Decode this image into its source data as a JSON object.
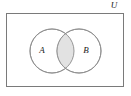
{
  "figure": {
    "kind": "venn-diagram",
    "width": 131,
    "height": 96,
    "background_color": "#ffffff"
  },
  "universe": {
    "label": "U",
    "label_x": 114,
    "label_y": 6,
    "rect": {
      "x": 6,
      "y": 13,
      "width": 118,
      "height": 74
    },
    "stroke_color": "#7a7a7a",
    "stroke_width": 1,
    "fill_color": "#ffffff"
  },
  "sets": [
    {
      "name": "set-a",
      "label": "A",
      "cx": 52,
      "cy": 51,
      "r": 22,
      "label_x": 42,
      "label_y": 51,
      "stroke_color": "#8c8c8c",
      "fill_color": "#ffffff"
    },
    {
      "name": "set-b",
      "label": "B",
      "cx": 79,
      "cy": 51,
      "r": 22,
      "label_x": 86,
      "label_y": 51,
      "stroke_color": "#8c8c8c",
      "fill_color": "#ffffff"
    }
  ],
  "intersection": {
    "name": "a-intersect-b",
    "fill_color": "#e2e2e2",
    "stroke_color": "#8c8c8c",
    "shaded": true
  }
}
